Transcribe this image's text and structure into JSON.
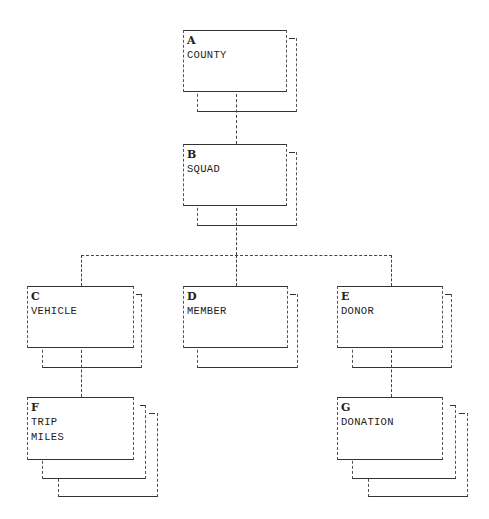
{
  "diagram": {
    "type": "hierarchical data model",
    "nodes": [
      {
        "id": "A",
        "letter": "A",
        "name": "COUNTY",
        "layers": 2
      },
      {
        "id": "B",
        "letter": "B",
        "name": "SQUAD",
        "layers": 2
      },
      {
        "id": "C",
        "letter": "C",
        "name": "VEHICLE",
        "layers": 2
      },
      {
        "id": "D",
        "letter": "D",
        "name": "MEMBER",
        "layers": 2
      },
      {
        "id": "E",
        "letter": "E",
        "name": "DONOR",
        "layers": 2
      },
      {
        "id": "F",
        "letter": "F",
        "name": "TRIP\nMILES",
        "layers": 3
      },
      {
        "id": "G",
        "letter": "G",
        "name": "DONATION",
        "layers": 3
      }
    ],
    "edges": [
      {
        "from": "A",
        "to": "B"
      },
      {
        "from": "B",
        "to": "C"
      },
      {
        "from": "B",
        "to": "D"
      },
      {
        "from": "B",
        "to": "E"
      },
      {
        "from": "C",
        "to": "F"
      },
      {
        "from": "E",
        "to": "G"
      }
    ]
  }
}
